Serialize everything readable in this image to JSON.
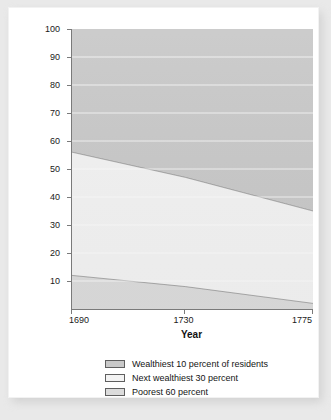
{
  "chart_data": {
    "type": "area",
    "stacked": true,
    "title": "",
    "xlabel": "Year",
    "ylabel": "Share of total taxable wealth (percentage)",
    "x": [
      1690,
      1730,
      1775
    ],
    "xlim": [
      1690,
      1775
    ],
    "ylim": [
      0,
      100
    ],
    "xticks": [
      "1690",
      "1730",
      "1775"
    ],
    "yticks": [
      "10",
      "20",
      "30",
      "40",
      "50",
      "60",
      "70",
      "80",
      "90",
      "100"
    ],
    "grid": true,
    "legend_position": "bottom",
    "series": [
      {
        "name": "Wealthiest 10 percent of residents",
        "values": [
          44,
          53,
          65
        ],
        "color": "#c9c9c9",
        "cumulative_top": [
          100,
          100,
          100
        ],
        "cumulative_bottom": [
          56,
          47,
          35
        ]
      },
      {
        "name": "Next wealthiest 30 percent",
        "values": [
          44,
          39,
          33
        ],
        "color": "#f3f3f3",
        "cumulative_top": [
          56,
          47,
          35
        ],
        "cumulative_bottom": [
          12,
          8,
          2
        ]
      },
      {
        "name": "Poorest 60 percent",
        "values": [
          12,
          8,
          2
        ],
        "color": "#dcdcdc",
        "cumulative_top": [
          12,
          8,
          2
        ],
        "cumulative_bottom": [
          0,
          0,
          0
        ]
      }
    ]
  },
  "axes": {
    "y_title": "Share of total taxable wealth (percentage)",
    "x_title": "Year",
    "y_ticks": [
      {
        "label": "100",
        "value": 100
      },
      {
        "label": "90",
        "value": 90
      },
      {
        "label": "80",
        "value": 80
      },
      {
        "label": "70",
        "value": 70
      },
      {
        "label": "60",
        "value": 60
      },
      {
        "label": "50",
        "value": 50
      },
      {
        "label": "40",
        "value": 40
      },
      {
        "label": "30",
        "value": 30
      },
      {
        "label": "20",
        "value": 20
      },
      {
        "label": "10",
        "value": 10
      }
    ],
    "x_ticks": [
      {
        "label": "1690",
        "value": 1690
      },
      {
        "label": "1730",
        "value": 1730
      },
      {
        "label": "1775",
        "value": 1775
      }
    ]
  },
  "legend": {
    "items": [
      {
        "label": "Wealthiest 10 percent of residents",
        "color": "#c9c9c9"
      },
      {
        "label": "Next wealthiest 30 percent",
        "color": "#f3f3f3"
      },
      {
        "label": "Poorest 60 percent",
        "color": "#dcdcdc"
      }
    ]
  }
}
